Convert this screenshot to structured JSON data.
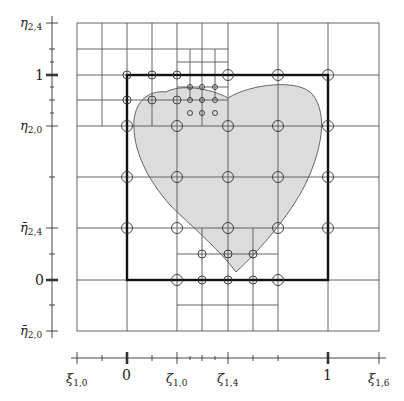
{
  "figure": {
    "type": "hierarchical-mesh-diagram",
    "colors": {
      "grid_line": "#555555",
      "bold_box": "#111111",
      "domain_fill": "#dcdcdc",
      "domain_stroke": "#666666",
      "node_stroke": "#333333"
    },
    "left_axis": {
      "labels": [
        {
          "text": "η",
          "sub": "2,4",
          "bar": false,
          "y": 23
        },
        {
          "text": "1",
          "sub": "",
          "bar": false,
          "y": 75,
          "bold_tick": true
        },
        {
          "text": "η",
          "sub": "2,0",
          "bar": false,
          "y": 126
        },
        {
          "text": "η̄",
          "sub": "2,4",
          "bar": true,
          "y": 228
        },
        {
          "text": "0",
          "sub": "",
          "bar": false,
          "y": 280,
          "bold_tick": true
        },
        {
          "text": "η̄",
          "sub": "2,0",
          "bar": true,
          "y": 331
        }
      ],
      "ticks_y": [
        23,
        49,
        62,
        75,
        87,
        100,
        113,
        126,
        177,
        228,
        254,
        280,
        305,
        331
      ]
    },
    "bottom_axis": {
      "labels": [
        {
          "text": "ξ",
          "sub": "1,0",
          "x": 77
        },
        {
          "text": "0",
          "sub": "",
          "x": 127,
          "bold_tick": true
        },
        {
          "text": "ζ",
          "sub": "1,0",
          "x": 177
        },
        {
          "text": "ζ",
          "sub": "1,4",
          "x": 228
        },
        {
          "text": "1",
          "sub": "",
          "x": 328,
          "bold_tick": true
        },
        {
          "text": "ξ",
          "sub": "1,6",
          "x": 379
        }
      ],
      "ticks_x": [
        77,
        102,
        127,
        152,
        177,
        190,
        202,
        215,
        228,
        253,
        278,
        328,
        379
      ]
    },
    "unit_square_label": "parametric domain [0,1]²",
    "legend": []
  }
}
